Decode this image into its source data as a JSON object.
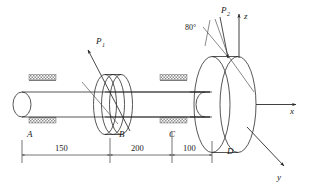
{
  "figure": {
    "type": "engineering-mechanics-diagram",
    "background_color": "#ffffff",
    "line_color": "#2b2b2b",
    "hatch_color": "#8a8a8a"
  },
  "points": {
    "a": "A",
    "b": "B",
    "c": "C",
    "d": "D"
  },
  "forces": {
    "p1": {
      "base": "P",
      "subscript": "1"
    },
    "p2": {
      "base": "P",
      "subscript": "2"
    }
  },
  "angle": {
    "value": "80°"
  },
  "axes": {
    "x": "x",
    "y": "y",
    "z": "z"
  },
  "dimensions": [
    {
      "label": "150",
      "from": "A",
      "to": "B"
    },
    {
      "label": "200",
      "from": "B",
      "to": "C"
    },
    {
      "label": "100",
      "from": "C",
      "to": "D"
    }
  ],
  "supports": {
    "left_bearing": "bearing-support-A",
    "right_bearing": "bearing-support-C"
  }
}
